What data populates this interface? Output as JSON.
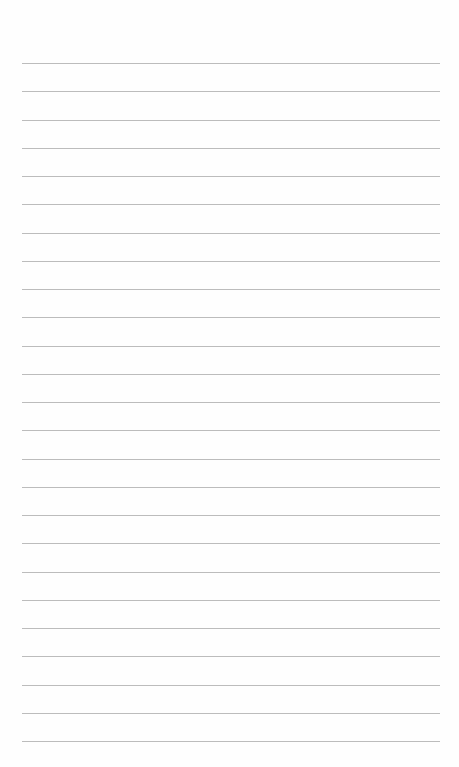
{
  "sheet": {
    "type": "blank-lined-paper",
    "background_color": "#fefefe",
    "rule_color": "#bcbcbc",
    "rule_count": 25,
    "first_rule_y": 63,
    "rule_spacing": 28.25,
    "rule_left": 22,
    "rule_right": 440,
    "text_lines": []
  }
}
